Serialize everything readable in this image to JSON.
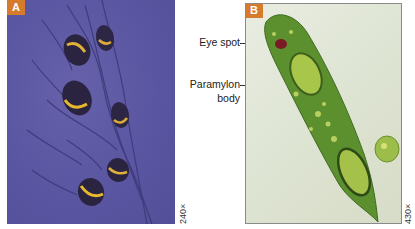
{
  "figure": {
    "panels": [
      {
        "id": "A",
        "badge": "A",
        "magnification": "240×",
        "description": "Differential interference contrast micrograph of several flagellated euglenoid cells on a purple background",
        "background_color": "#5d58a0",
        "badge_color": "#d67a2b"
      },
      {
        "id": "B",
        "badge": "B",
        "magnification": "430×",
        "description": "Light micrograph of an elongated green Euglena cell with red eye spot and paramylon bodies",
        "background_color": "#e3e8da",
        "badge_color": "#d67a2b",
        "labels": [
          {
            "text": "Eye spot"
          },
          {
            "text_line1": "Paramylon",
            "text_line2": "body"
          }
        ]
      }
    ]
  }
}
